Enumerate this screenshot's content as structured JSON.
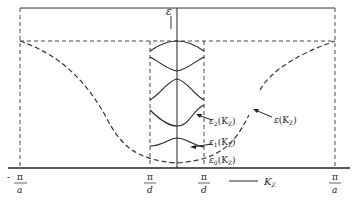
{
  "diagram": {
    "axis": {
      "vertical_label": "ε",
      "horizontal_label": "K",
      "horizontal_label_sub": "Z"
    },
    "ticks": [
      {
        "id": "neg-pi-a",
        "sign": "-",
        "num": "π",
        "den": "a"
      },
      {
        "id": "neg-pi-d",
        "sign": "",
        "num": "π",
        "den": "d"
      },
      {
        "id": "pos-pi-d",
        "sign": "",
        "num": "π",
        "den": "d"
      },
      {
        "id": "pos-pi-a",
        "sign": "",
        "num": "π",
        "den": "a"
      }
    ],
    "curve_labels": {
      "bulk": {
        "sym": "ε",
        "sub": "",
        "arg": "(K",
        "argsub": "Z",
        "close": ")"
      },
      "band2": {
        "sym": "ε",
        "sub": "2",
        "arg": "(K",
        "argsub": "Z",
        "close": ")"
      },
      "band1": {
        "sym": "ε",
        "sub": "1",
        "arg": "(K",
        "argsub": "Z",
        "close": ")"
      },
      "band0": {
        "sym": "ε",
        "sub": "0",
        "arg": "(K",
        "argsub": "Z",
        "close": ")"
      }
    },
    "colors": {
      "line": "#222222",
      "dash": "#333333"
    }
  }
}
